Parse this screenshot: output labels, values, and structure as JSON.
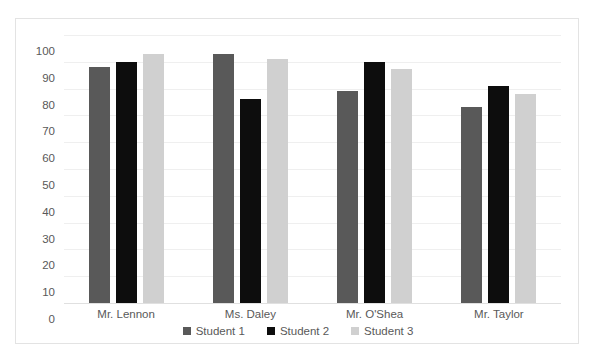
{
  "chart_data": {
    "type": "bar",
    "title": "",
    "xlabel": "",
    "ylabel": "",
    "ylim": [
      0,
      100
    ],
    "ytick_step": 10,
    "yticks": [
      "100",
      "90",
      "80",
      "70",
      "60",
      "50",
      "40",
      "30",
      "20",
      "10",
      "0"
    ],
    "grid": true,
    "legend_position": "bottom-center",
    "categories": [
      "Mr. Lennon",
      "Ms. Daley",
      "Mr. O'Shea",
      "Mr. Taylor"
    ],
    "series": [
      {
        "name": "Student 1",
        "color": "#595959",
        "values": [
          88,
          93,
          79,
          73
        ]
      },
      {
        "name": "Student 2",
        "color": "#0d0d0d",
        "values": [
          90,
          76,
          90,
          81
        ]
      },
      {
        "name": "Student 3",
        "color": "#d0d0d0",
        "values": [
          93,
          91,
          87.5,
          78
        ]
      }
    ]
  },
  "frame": {
    "border_color": "#e3e3e3",
    "gridline_color": "#efefef",
    "baseline_color": "#e0e0e0",
    "background": "#ffffff",
    "text_color": "#595959"
  },
  "title_remnant": ""
}
